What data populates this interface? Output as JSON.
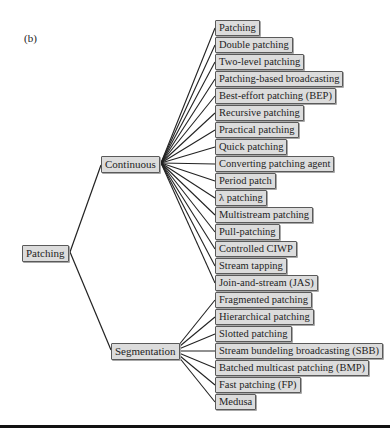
{
  "figure_label": "(b)",
  "root": {
    "label": "Patching",
    "x": 22,
    "y": 245,
    "jx": 70,
    "jy": 252
  },
  "branches": [
    {
      "label": "Continuous",
      "x": 101,
      "y": 156,
      "lx": 101,
      "ly": 165,
      "jx": 161,
      "jy": 163,
      "child_x": 215,
      "child_y0": 20,
      "child_step": 17,
      "children": [
        "Patching",
        "Double patching",
        "Two-level patching",
        "Patching-based broadcasting",
        "Best-effort patching (BEP)",
        "Recursive patching",
        "Practical patching",
        "Quick patching",
        "Converting patching agent",
        "Period patch",
        "λ patching",
        "Multistream patching",
        "Pull-patching",
        "Controlled CIWP",
        "Stream tapping",
        "Join-and-stream (JAS)"
      ]
    },
    {
      "label": "Segmentation",
      "x": 111,
      "y": 343,
      "lx": 111,
      "ly": 350,
      "jx": 174,
      "jy": 351,
      "child_x": 215,
      "child_y0": 292,
      "child_step": 17,
      "children": [
        "Fragmented patching",
        "Hierarchical patching",
        "Slotted patching",
        "Stream bundeling broadcasting (SBB)",
        "Batched multicast patching (BMP)",
        "Fast patching (FP)",
        "Medusa"
      ]
    }
  ],
  "colors": {
    "node_fill": "#dcdcdc",
    "node_border": "#5a5a5a",
    "edge": "#222222",
    "rule": "#111111"
  }
}
